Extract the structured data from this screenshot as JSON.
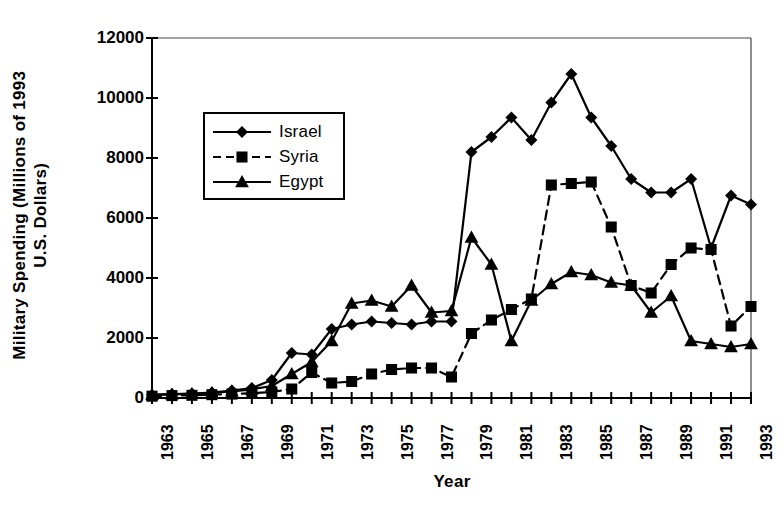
{
  "chart_data": {
    "type": "line",
    "title": "",
    "xlabel": "Year",
    "ylabel": "Military Spending (Millions of 1993 U.S. Dollars)",
    "ylabel_line1": "Military Spending (Millions of 1993",
    "ylabel_line2": "U.S. Dollars)",
    "xlim": [
      1963,
      1993
    ],
    "ylim": [
      0,
      12000
    ],
    "ytick_labels": [
      "0",
      "2000",
      "4000",
      "6000",
      "8000",
      "10000",
      "12000"
    ],
    "ytick_values": [
      0,
      2000,
      4000,
      6000,
      8000,
      10000,
      12000
    ],
    "xtick_labels": [
      "1963",
      "1965",
      "1967",
      "1969",
      "1971",
      "1973",
      "1975",
      "1977",
      "1979",
      "1981",
      "1983",
      "1985",
      "1987",
      "1989",
      "1991",
      "1993"
    ],
    "xtick_values": [
      1963,
      1965,
      1967,
      1969,
      1971,
      1973,
      1975,
      1977,
      1979,
      1981,
      1983,
      1985,
      1987,
      1989,
      1991,
      1993
    ],
    "grid": false,
    "legend_position": "upper-left-inside",
    "x": [
      1963,
      1964,
      1965,
      1966,
      1967,
      1968,
      1969,
      1970,
      1971,
      1972,
      1973,
      1974,
      1975,
      1976,
      1977,
      1978,
      1979,
      1980,
      1981,
      1982,
      1983,
      1984,
      1985,
      1986,
      1987,
      1988,
      1989,
      1990,
      1991,
      1992,
      1993
    ],
    "series": [
      {
        "name": "Israel",
        "marker": "diamond",
        "line_style": "solid",
        "color": "#000000",
        "values": [
          110,
          130,
          150,
          180,
          250,
          330,
          600,
          1500,
          1450,
          2300,
          2450,
          2550,
          2500,
          2450,
          2550,
          2550,
          8200,
          8700,
          9350,
          8600,
          9850,
          10800,
          9350,
          8400,
          7300,
          6850,
          6850,
          7300,
          5000,
          6750,
          6450
        ]
      },
      {
        "name": "Syria",
        "marker": "square",
        "line_style": "dashed",
        "color": "#000000",
        "values": [
          60,
          80,
          90,
          110,
          130,
          160,
          200,
          300,
          850,
          500,
          550,
          800,
          950,
          1000,
          1000,
          700,
          2150,
          2600,
          2950,
          3300,
          7100,
          7150,
          7200,
          5700,
          3750,
          3500,
          4450,
          5000,
          4950,
          2400,
          3050
        ]
      },
      {
        "name": "Egypt",
        "marker": "triangle",
        "line_style": "solid",
        "color": "#000000",
        "values": [
          100,
          120,
          140,
          170,
          220,
          290,
          400,
          800,
          1200,
          1900,
          3150,
          3250,
          3050,
          3750,
          2850,
          2900,
          5350,
          4450,
          1900,
          3250,
          3800,
          4200,
          4100,
          3850,
          3750,
          2850,
          3400,
          1900,
          1800,
          1700,
          1800
        ]
      }
    ]
  },
  "legend": {
    "items": [
      {
        "label": "Israel",
        "marker": "diamond",
        "line_style": "solid"
      },
      {
        "label": "Syria",
        "marker": "square",
        "line_style": "dashed"
      },
      {
        "label": "Egypt",
        "marker": "triangle",
        "line_style": "solid"
      }
    ]
  }
}
